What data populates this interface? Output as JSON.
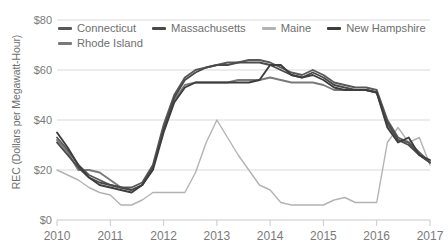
{
  "chart_data": {
    "type": "line",
    "title": "",
    "xlabel": "",
    "ylabel": "REC (Dollars per Megawatt-Hour)",
    "ylim": [
      0,
      80
    ],
    "xlim": [
      2010,
      2017
    ],
    "yticks": [
      "$0",
      "$20",
      "$40",
      "$60",
      "$80"
    ],
    "ytick_values": [
      0,
      20,
      40,
      60,
      80
    ],
    "xticks": [
      "2010",
      "2011",
      "2012",
      "2013",
      "2014",
      "2015",
      "2016",
      "2017"
    ],
    "xtick_values": [
      2010,
      2011,
      2012,
      2013,
      2014,
      2015,
      2016,
      2017
    ],
    "grid": true,
    "legend_position": "top",
    "series": [
      {
        "name": "Connecticut",
        "color": "#595959",
        "x": [
          2010.0,
          2010.2,
          2010.4,
          2010.6,
          2010.8,
          2011.0,
          2011.2,
          2011.4,
          2011.6,
          2011.8,
          2012.0,
          2012.2,
          2012.4,
          2012.6,
          2012.8,
          2013.0,
          2013.2,
          2013.4,
          2013.6,
          2013.8,
          2014.0,
          2014.2,
          2014.4,
          2014.6,
          2014.8,
          2015.0,
          2015.2,
          2015.4,
          2015.6,
          2015.8,
          2016.0,
          2016.2,
          2016.4,
          2016.6,
          2016.8,
          2017.0
        ],
        "values": [
          33,
          28,
          22,
          18,
          16,
          14,
          13,
          13,
          15,
          22,
          38,
          50,
          57,
          60,
          61,
          62,
          63,
          63,
          64,
          64,
          63,
          61,
          59,
          58,
          60,
          58,
          55,
          54,
          53,
          53,
          52,
          40,
          33,
          31,
          27,
          23
        ]
      },
      {
        "name": "Massachusetts",
        "color": "#4a4a4a",
        "x": [
          2010.0,
          2010.2,
          2010.4,
          2010.6,
          2010.8,
          2011.0,
          2011.2,
          2011.4,
          2011.6,
          2011.8,
          2012.0,
          2012.2,
          2012.4,
          2012.6,
          2012.8,
          2013.0,
          2013.2,
          2013.4,
          2013.6,
          2013.8,
          2014.0,
          2014.2,
          2014.4,
          2014.6,
          2014.8,
          2015.0,
          2015.2,
          2015.4,
          2015.6,
          2015.8,
          2016.0,
          2016.2,
          2016.4,
          2016.6,
          2016.8,
          2017.0
        ],
        "values": [
          31,
          26,
          21,
          17,
          15,
          14,
          13,
          12,
          14,
          21,
          36,
          49,
          56,
          59,
          61,
          62,
          62,
          63,
          63,
          63,
          62,
          60,
          58,
          57,
          59,
          57,
          54,
          53,
          52,
          52,
          51,
          39,
          32,
          30,
          26,
          23
        ]
      },
      {
        "name": "Maine",
        "color": "#b3b3b3",
        "x": [
          2010.0,
          2010.2,
          2010.4,
          2010.6,
          2010.8,
          2011.0,
          2011.2,
          2011.4,
          2011.6,
          2011.8,
          2012.0,
          2012.2,
          2012.4,
          2012.6,
          2012.8,
          2013.0,
          2013.2,
          2013.4,
          2013.6,
          2013.8,
          2014.0,
          2014.2,
          2014.4,
          2014.6,
          2014.8,
          2015.0,
          2015.2,
          2015.4,
          2015.6,
          2015.8,
          2016.0,
          2016.2,
          2016.4,
          2016.6,
          2016.8,
          2017.0
        ],
        "values": [
          20,
          18,
          16,
          13,
          11,
          10,
          6,
          6,
          8,
          11,
          11,
          11,
          11,
          19,
          31,
          40,
          33,
          26,
          20,
          14,
          12,
          7,
          6,
          6,
          6,
          6,
          8,
          9,
          7,
          7,
          7,
          31,
          37,
          31,
          33,
          22
        ]
      },
      {
        "name": "New Hampshire",
        "color": "#3d3d3d",
        "x": [
          2010.0,
          2010.2,
          2010.4,
          2010.6,
          2010.8,
          2011.0,
          2011.2,
          2011.4,
          2011.6,
          2011.8,
          2012.0,
          2012.2,
          2012.4,
          2012.6,
          2012.8,
          2013.0,
          2013.2,
          2013.4,
          2013.6,
          2013.8,
          2014.0,
          2014.2,
          2014.4,
          2014.6,
          2014.8,
          2015.0,
          2015.2,
          2015.4,
          2015.6,
          2015.8,
          2016.0,
          2016.2,
          2016.4,
          2016.6,
          2016.8,
          2017.0
        ],
        "values": [
          35,
          29,
          22,
          17,
          14,
          13,
          12,
          11,
          14,
          20,
          35,
          47,
          53,
          55,
          55,
          55,
          55,
          55,
          55,
          56,
          62,
          62,
          58,
          57,
          58,
          56,
          53,
          52,
          52,
          52,
          51,
          37,
          31,
          33,
          26,
          24
        ]
      },
      {
        "name": "Rhode Island",
        "color": "#7a7a7a",
        "x": [
          2010.0,
          2010.2,
          2010.4,
          2010.6,
          2010.8,
          2011.0,
          2011.2,
          2011.4,
          2011.6,
          2011.8,
          2012.0,
          2012.2,
          2012.4,
          2012.6,
          2012.8,
          2013.0,
          2013.2,
          2013.4,
          2013.6,
          2013.8,
          2014.0,
          2014.2,
          2014.4,
          2014.6,
          2014.8,
          2015.0,
          2015.2,
          2015.4,
          2015.6,
          2015.8,
          2016.0,
          2016.2,
          2016.4,
          2016.6,
          2016.8,
          2017.0
        ],
        "values": [
          32,
          27,
          20,
          20,
          19,
          16,
          13,
          12,
          14,
          21,
          37,
          48,
          54,
          55,
          55,
          55,
          55,
          56,
          56,
          56,
          57,
          56,
          55,
          55,
          55,
          54,
          52,
          52,
          52,
          52,
          51,
          38,
          32,
          31,
          26,
          23
        ]
      }
    ]
  },
  "legend": {
    "items": [
      {
        "label": "Connecticut"
      },
      {
        "label": "Massachusetts"
      },
      {
        "label": "Maine"
      },
      {
        "label": "New Hampshire"
      },
      {
        "label": "Rhode Island"
      }
    ]
  }
}
